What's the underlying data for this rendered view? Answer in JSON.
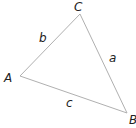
{
  "diagram": {
    "type": "triangle",
    "vertices": [
      {
        "id": "A",
        "label": "A",
        "x": 20,
        "y": 76,
        "lx": 4,
        "ly": 82
      },
      {
        "id": "B",
        "label": "B",
        "x": 127,
        "y": 113,
        "lx": 129,
        "ly": 124
      },
      {
        "id": "C",
        "label": "C",
        "x": 80,
        "y": 14,
        "lx": 74,
        "ly": 11
      }
    ],
    "sides": [
      {
        "id": "a",
        "label": "a",
        "from": "B",
        "to": "C",
        "lx": 109,
        "ly": 62
      },
      {
        "id": "b",
        "label": "b",
        "from": "A",
        "to": "C",
        "lx": 39,
        "ly": 42
      },
      {
        "id": "c",
        "label": "c",
        "from": "A",
        "to": "B",
        "lx": 66,
        "ly": 107
      }
    ],
    "stroke_color": "#b0b0b0",
    "label_color": "#222222"
  }
}
